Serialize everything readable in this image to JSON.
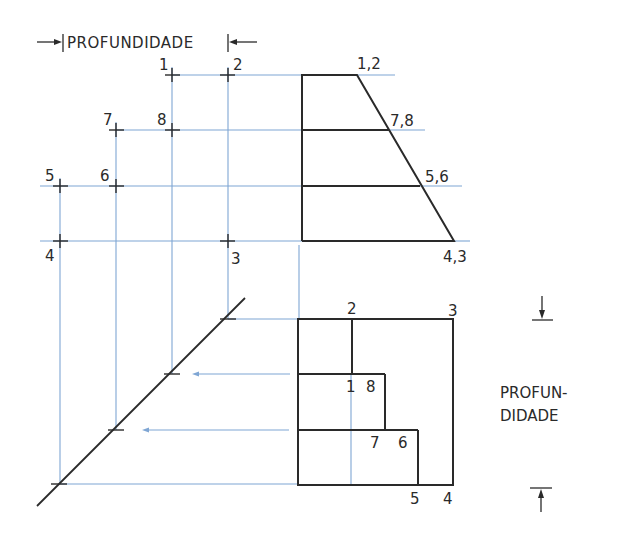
{
  "diagram": {
    "top_dimension": {
      "label": "PROFUNDIDADE"
    },
    "side_dimension": {
      "label_line1": "PROFUN-",
      "label_line2": "DIDADE"
    },
    "left_points": [
      {
        "id": "p1",
        "label": "1"
      },
      {
        "id": "p2",
        "label": "2"
      },
      {
        "id": "p7",
        "label": "7"
      },
      {
        "id": "p8",
        "label": "8"
      },
      {
        "id": "p5",
        "label": "5"
      },
      {
        "id": "p6",
        "label": "6"
      },
      {
        "id": "p4",
        "label": "4"
      },
      {
        "id": "p3",
        "label": "3"
      }
    ],
    "front_view": {
      "labels": {
        "top": "1,2",
        "upper_mid": "7,8",
        "lower_mid": "5,6",
        "bottom": "4,3"
      }
    },
    "top_view": {
      "labels": {
        "top_left": "2",
        "top_right": "3",
        "mid_1": "1",
        "mid_8": "8",
        "low_7": "7",
        "low_6": "6",
        "bottom_5": "5",
        "bottom_4": "4"
      }
    },
    "colors": {
      "projection_line": "#7fa6d4",
      "object_line": "#2a2a2a",
      "background": "#ffffff"
    }
  }
}
